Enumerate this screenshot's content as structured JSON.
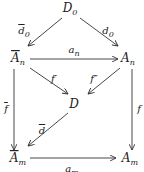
{
  "diagram": {
    "type": "commutative-diagram",
    "nodes": [
      {
        "id": "D0",
        "base": "D",
        "sub": "0",
        "bar": false
      },
      {
        "id": "An_bar",
        "base": "A",
        "sub": "n",
        "bar": true
      },
      {
        "id": "An",
        "base": "A",
        "sub": "n",
        "bar": false
      },
      {
        "id": "D",
        "base": "D",
        "sub": "",
        "bar": false
      },
      {
        "id": "Am_bar",
        "base": "A",
        "sub": "m",
        "bar": true
      },
      {
        "id": "Am",
        "base": "A",
        "sub": "m",
        "bar": false
      }
    ],
    "edges": [
      {
        "from": "D0",
        "to": "An_bar",
        "label": "d",
        "sub": "0",
        "bar": true
      },
      {
        "from": "D0",
        "to": "An",
        "label": "d",
        "sub": "0",
        "bar": false
      },
      {
        "from": "An_bar",
        "to": "An",
        "label": "a",
        "sub": "n",
        "bar": false
      },
      {
        "from": "An_bar",
        "to": "D",
        "label": "f′",
        "sub": "",
        "bar": false
      },
      {
        "from": "An",
        "to": "D",
        "label": "f″",
        "sub": "",
        "bar": false
      },
      {
        "from": "D",
        "to": "Am_bar",
        "label": "d",
        "sub": "",
        "bar": true
      },
      {
        "from": "An_bar",
        "to": "Am_bar",
        "label": "f",
        "sub": "",
        "bar": true
      },
      {
        "from": "An",
        "to": "Am",
        "label": "f",
        "sub": "",
        "bar": false
      },
      {
        "from": "Am_bar",
        "to": "Am",
        "label": "a",
        "sub": "m",
        "bar": false
      }
    ]
  }
}
